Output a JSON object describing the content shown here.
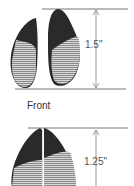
{
  "diagram": {
    "top_track": {
      "measurement": "1.5\"",
      "shape": "hoof-print-spread"
    },
    "caption": "Front",
    "bottom_track": {
      "measurement": "1.25\"",
      "shape": "hoof-print-closed"
    },
    "colors": {
      "dark": "#2a2a2a",
      "light": "#9a9a9a",
      "line": "#777777"
    }
  }
}
